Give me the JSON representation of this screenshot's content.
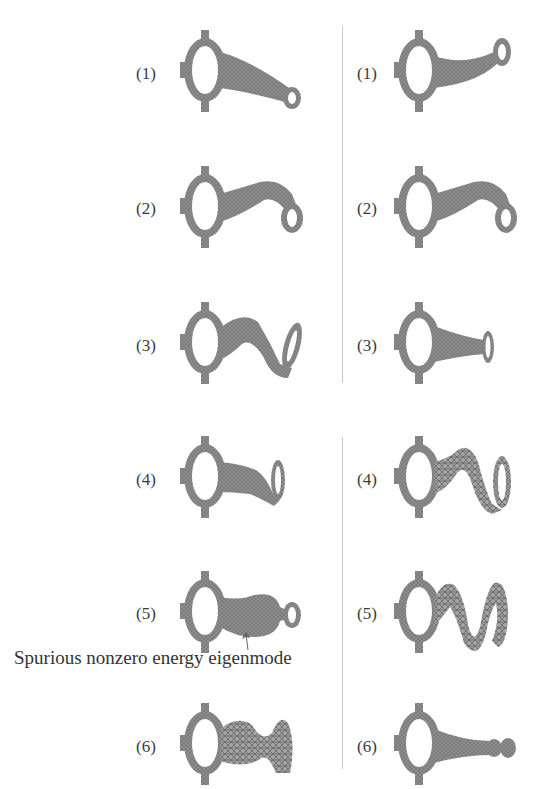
{
  "figure": {
    "left_column": {
      "modes": [
        {
          "label": "(1)",
          "shape": "straight-taper-end-ring-down"
        },
        {
          "label": "(2)",
          "shape": "bend-down-ring"
        },
        {
          "label": "(3)",
          "shape": "s-curve-ring"
        },
        {
          "label": "(4)",
          "shape": "short-bend-ring"
        },
        {
          "label": "(5)",
          "shape": "bulged-spurious"
        },
        {
          "label": "(6)",
          "shape": "chaotic-wave"
        }
      ]
    },
    "right_column": {
      "modes": [
        {
          "label": "(1)",
          "shape": "taper-end-ring-up"
        },
        {
          "label": "(2)",
          "shape": "bend-down-ring"
        },
        {
          "label": "(3)",
          "shape": "straight-short-taper"
        },
        {
          "label": "(4)",
          "shape": "s-wave-ring"
        },
        {
          "label": "(5)",
          "shape": "double-wave"
        },
        {
          "label": "(6)",
          "shape": "bulb-chain"
        }
      ]
    },
    "annotation": {
      "text": "Spurious nonzero energy eigenmode",
      "points_to": "left-mode-5"
    },
    "colors": {
      "mesh": "#8a8a8a",
      "divider": "#c8c8c8",
      "text": "#3a3a3a"
    }
  }
}
